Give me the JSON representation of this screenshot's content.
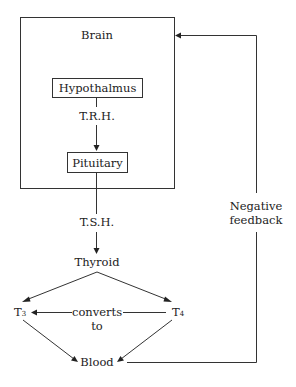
{
  "diagram": {
    "nodes": {
      "brain": "Brain",
      "hypothalmus": "Hypothalmus",
      "trh": "T.R.H.",
      "pituitary": "Pituitary",
      "tsh": "T.S.H.",
      "thyroid": "Thyroid",
      "t3_base": "T",
      "t3_sub": "3",
      "t4_base": "T",
      "t4_sub": "4",
      "converts_line1": "converts",
      "converts_line2": "to",
      "blood": "Blood",
      "feedback_line1": "Negative",
      "feedback_line2": "feedback"
    },
    "edges": [
      {
        "from": "Hypothalmus",
        "to": "Pituitary",
        "label": "T.R.H."
      },
      {
        "from": "Pituitary",
        "to": "Thyroid",
        "label": "T.S.H."
      },
      {
        "from": "Thyroid",
        "to": "T3"
      },
      {
        "from": "Thyroid",
        "to": "T4"
      },
      {
        "from": "T4",
        "to": "T3",
        "label": "converts to"
      },
      {
        "from": "T3",
        "to": "Blood"
      },
      {
        "from": "T4",
        "to": "Blood"
      },
      {
        "from": "Blood",
        "to": "Brain",
        "label": "Negative feedback"
      }
    ],
    "colors": {
      "line": "#333333",
      "text": "#222222",
      "background": "#ffffff"
    }
  }
}
